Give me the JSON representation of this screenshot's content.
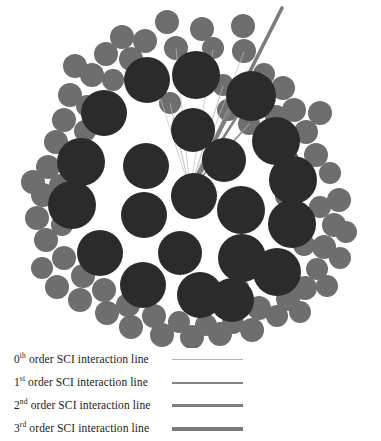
{
  "figure": {
    "colors": {
      "core_circle": "#2b2b2b",
      "outer_circle": "#6e6e6e",
      "background": "#ffffff",
      "line_0th": "#b4b4b4",
      "line_1st": "#848484",
      "line_2nd": "#7e7e7e",
      "line_3rd": "#7a7a7a"
    },
    "core_circles": [
      {
        "cx": 147,
        "cy": 80,
        "r": 23
      },
      {
        "cx": 196,
        "cy": 75,
        "r": 24
      },
      {
        "cx": 251,
        "cy": 96,
        "r": 25
      },
      {
        "cx": 104,
        "cy": 113,
        "r": 23
      },
      {
        "cx": 193,
        "cy": 130,
        "r": 22
      },
      {
        "cx": 276,
        "cy": 141,
        "r": 24
      },
      {
        "cx": 81,
        "cy": 162,
        "r": 24
      },
      {
        "cx": 146,
        "cy": 166,
        "r": 23
      },
      {
        "cx": 224,
        "cy": 160,
        "r": 22
      },
      {
        "cx": 293,
        "cy": 180,
        "r": 24
      },
      {
        "cx": 72,
        "cy": 205,
        "r": 24
      },
      {
        "cx": 194,
        "cy": 196,
        "r": 23
      },
      {
        "cx": 241,
        "cy": 210,
        "r": 24
      },
      {
        "cx": 292,
        "cy": 224,
        "r": 24
      },
      {
        "cx": 144,
        "cy": 215,
        "r": 23
      },
      {
        "cx": 100,
        "cy": 253,
        "r": 23
      },
      {
        "cx": 180,
        "cy": 253,
        "r": 22
      },
      {
        "cx": 242,
        "cy": 258,
        "r": 24
      },
      {
        "cx": 277,
        "cy": 272,
        "r": 24
      },
      {
        "cx": 143,
        "cy": 285,
        "r": 23
      },
      {
        "cx": 200,
        "cy": 295,
        "r": 23
      },
      {
        "cx": 232,
        "cy": 300,
        "r": 22
      }
    ],
    "outer_circles": [
      {
        "cx": 167,
        "cy": 22,
        "r": 12
      },
      {
        "cx": 202,
        "cy": 29,
        "r": 12
      },
      {
        "cx": 145,
        "cy": 41,
        "r": 12
      },
      {
        "cx": 176,
        "cy": 48,
        "r": 12
      },
      {
        "cx": 213,
        "cy": 48,
        "r": 11
      },
      {
        "cx": 243,
        "cy": 26,
        "r": 12
      },
      {
        "cx": 244,
        "cy": 51,
        "r": 12
      },
      {
        "cx": 122,
        "cy": 37,
        "r": 12
      },
      {
        "cx": 106,
        "cy": 54,
        "r": 12
      },
      {
        "cx": 131,
        "cy": 59,
        "r": 12
      },
      {
        "cx": 92,
        "cy": 75,
        "r": 12
      },
      {
        "cx": 113,
        "cy": 80,
        "r": 11
      },
      {
        "cx": 75,
        "cy": 66,
        "r": 12
      },
      {
        "cx": 70,
        "cy": 95,
        "r": 12
      },
      {
        "cx": 64,
        "cy": 120,
        "r": 12
      },
      {
        "cx": 87,
        "cy": 106,
        "r": 11
      },
      {
        "cx": 85,
        "cy": 131,
        "r": 11
      },
      {
        "cx": 56,
        "cy": 142,
        "r": 12
      },
      {
        "cx": 48,
        "cy": 167,
        "r": 12
      },
      {
        "cx": 60,
        "cy": 185,
        "r": 11
      },
      {
        "cx": 43,
        "cy": 195,
        "r": 12
      },
      {
        "cx": 33,
        "cy": 182,
        "r": 12
      },
      {
        "cx": 37,
        "cy": 218,
        "r": 12
      },
      {
        "cx": 46,
        "cy": 240,
        "r": 12
      },
      {
        "cx": 62,
        "cy": 225,
        "r": 11
      },
      {
        "cx": 64,
        "cy": 258,
        "r": 12
      },
      {
        "cx": 42,
        "cy": 268,
        "r": 11
      },
      {
        "cx": 57,
        "cy": 287,
        "r": 12
      },
      {
        "cx": 83,
        "cy": 276,
        "r": 12
      },
      {
        "cx": 80,
        "cy": 300,
        "r": 12
      },
      {
        "cx": 104,
        "cy": 290,
        "r": 12
      },
      {
        "cx": 107,
        "cy": 313,
        "r": 12
      },
      {
        "cx": 128,
        "cy": 305,
        "r": 12
      },
      {
        "cx": 131,
        "cy": 327,
        "r": 12
      },
      {
        "cx": 154,
        "cy": 316,
        "r": 12
      },
      {
        "cx": 162,
        "cy": 335,
        "r": 12
      },
      {
        "cx": 179,
        "cy": 322,
        "r": 11
      },
      {
        "cx": 192,
        "cy": 337,
        "r": 12
      },
      {
        "cx": 206,
        "cy": 325,
        "r": 11
      },
      {
        "cx": 220,
        "cy": 334,
        "r": 12
      },
      {
        "cx": 233,
        "cy": 323,
        "r": 11
      },
      {
        "cx": 252,
        "cy": 330,
        "r": 12
      },
      {
        "cx": 259,
        "cy": 308,
        "r": 12
      },
      {
        "cx": 277,
        "cy": 316,
        "r": 11
      },
      {
        "cx": 288,
        "cy": 299,
        "r": 12
      },
      {
        "cx": 300,
        "cy": 312,
        "r": 11
      },
      {
        "cx": 305,
        "cy": 288,
        "r": 12
      },
      {
        "cx": 317,
        "cy": 269,
        "r": 11
      },
      {
        "cx": 327,
        "cy": 286,
        "r": 11
      },
      {
        "cx": 324,
        "cy": 247,
        "r": 12
      },
      {
        "cx": 340,
        "cy": 258,
        "r": 11
      },
      {
        "cx": 334,
        "cy": 225,
        "r": 12
      },
      {
        "cx": 346,
        "cy": 232,
        "r": 11
      },
      {
        "cx": 339,
        "cy": 200,
        "r": 12
      },
      {
        "cx": 320,
        "cy": 207,
        "r": 11
      },
      {
        "cx": 316,
        "cy": 155,
        "r": 12
      },
      {
        "cx": 330,
        "cy": 173,
        "r": 11
      },
      {
        "cx": 306,
        "cy": 132,
        "r": 12
      },
      {
        "cx": 320,
        "cy": 113,
        "r": 12
      },
      {
        "cx": 294,
        "cy": 110,
        "r": 12
      },
      {
        "cx": 283,
        "cy": 88,
        "r": 12
      },
      {
        "cx": 264,
        "cy": 74,
        "r": 11
      },
      {
        "cx": 276,
        "cy": 116,
        "r": 11
      },
      {
        "cx": 288,
        "cy": 160,
        "r": 11
      },
      {
        "cx": 249,
        "cy": 124,
        "r": 11
      },
      {
        "cx": 228,
        "cy": 110,
        "r": 11
      },
      {
        "cx": 223,
        "cy": 85,
        "r": 11
      },
      {
        "cx": 170,
        "cy": 103,
        "r": 11
      },
      {
        "cx": 286,
        "cy": 196,
        "r": 11
      },
      {
        "cx": 304,
        "cy": 245,
        "r": 11
      },
      {
        "cx": 238,
        "cy": 288,
        "r": 11
      },
      {
        "cx": 212,
        "cy": 300,
        "r": 11
      }
    ],
    "interaction_lines": [
      {
        "order": "0th",
        "x1": 190,
        "y1": 190,
        "x2": 148,
        "y2": 60,
        "width": 0.7,
        "color": "#bdbdbd"
      },
      {
        "order": "0th",
        "x1": 190,
        "y1": 190,
        "x2": 176,
        "y2": 48,
        "width": 0.7,
        "color": "#bdbdbd"
      },
      {
        "order": "0th",
        "x1": 190,
        "y1": 190,
        "x2": 213,
        "y2": 50,
        "width": 0.7,
        "color": "#bdbdbd"
      },
      {
        "order": "0th",
        "x1": 190,
        "y1": 190,
        "x2": 244,
        "y2": 52,
        "width": 0.7,
        "color": "#bdbdbd"
      },
      {
        "order": "0th",
        "x1": 190,
        "y1": 190,
        "x2": 170,
        "y2": 103,
        "width": 0.8,
        "color": "#b0b0b0"
      },
      {
        "order": "0th",
        "x1": 190,
        "y1": 190,
        "x2": 223,
        "y2": 86,
        "width": 0.8,
        "color": "#b0b0b0"
      },
      {
        "order": "1st",
        "x1": 190,
        "y1": 190,
        "x2": 228,
        "y2": 110,
        "width": 1.8,
        "color": "#8e8e8e"
      },
      {
        "order": "1st",
        "x1": 190,
        "y1": 190,
        "x2": 249,
        "y2": 124,
        "width": 1.8,
        "color": "#8e8e8e"
      },
      {
        "order": "2nd",
        "x1": 190,
        "y1": 190,
        "x2": 264,
        "y2": 74,
        "width": 2.6,
        "color": "#828282"
      },
      {
        "order": "3rd",
        "x1": 190,
        "y1": 190,
        "x2": 282,
        "y2": 8,
        "width": 3.6,
        "color": "#7c7c7c"
      }
    ]
  },
  "legend": {
    "items": [
      {
        "prefix": "0",
        "sup": "th",
        "label": " order SCI interaction line"
      },
      {
        "prefix": "1",
        "sup": "st",
        "label": " order SCI interaction line"
      },
      {
        "prefix": "2",
        "sup": "nd",
        "label": " order SCI interaction line"
      },
      {
        "prefix": "3",
        "sup": "rd",
        "label": " order SCI interaction line"
      }
    ]
  }
}
